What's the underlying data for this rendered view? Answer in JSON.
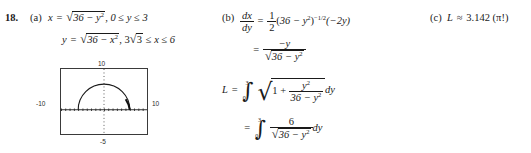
{
  "problem": {
    "number": "18.",
    "parts": {
      "a": "(a)",
      "b": "(b)",
      "c": "(c)"
    }
  },
  "part_a": {
    "line1": {
      "lhs_var": "x",
      "equals": "=",
      "radicand": "36 − y",
      "radicand_exp": "2",
      "comma": ",",
      "domain": "0 ≤ y ≤ 3"
    },
    "line2": {
      "lhs_var": "y",
      "equals": "=",
      "radicand": "36 − x",
      "radicand_exp": "2",
      "comma": ",",
      "domain_coef": "3",
      "domain_radicand": "3",
      "domain_rest": "≤ x ≤ 6"
    }
  },
  "part_b": {
    "line1": {
      "deriv_num": "dx",
      "deriv_den": "dy",
      "equals": "=",
      "coef_num": "1",
      "coef_den": "2",
      "paren_open": "(",
      "base": "36 − y",
      "base_exp": "2",
      "paren_close": ")",
      "power": "−1/2",
      "factor": "(−2y)"
    },
    "line2": {
      "equals": "=",
      "numerator": "−y",
      "denom_radicand": "36 − y",
      "denom_exp": "2"
    },
    "line3": {
      "L": "L",
      "equals": "=",
      "int_lower": "0",
      "int_upper": "3",
      "one_plus": "1 +",
      "frac_num": "y",
      "frac_num_exp": "2",
      "frac_den": "36 − y",
      "frac_den_exp": "2",
      "differential": "dy"
    },
    "line4": {
      "equals": "=",
      "int_lower": "0",
      "int_upper": "3",
      "frac_num": "6",
      "frac_den_radicand": "36 − y",
      "frac_den_exp": "2",
      "differential": "dy"
    }
  },
  "part_c": {
    "L": "L",
    "approx": "≈",
    "value": "3.142",
    "note": "(π!)"
  },
  "graph": {
    "top_label": "10",
    "left_label": "-10",
    "right_label": "10",
    "bottom_label": "-5",
    "curve_description": "semicircle",
    "axis_color": "#2b2b2b",
    "border_color": "#3a3a3a"
  }
}
